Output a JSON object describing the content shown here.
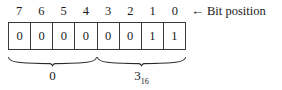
{
  "figure": {
    "type": "bit-field-diagram",
    "background_color": "#ffffff",
    "text_color": "#1a1a1a",
    "border_color": "#3a3a3a"
  },
  "bit_positions": {
    "labels": [
      "7",
      "6",
      "5",
      "4",
      "3",
      "2",
      "1",
      "0"
    ],
    "caption": "Bit position",
    "arrow": "←",
    "arrow_icon_name": "left-arrow-icon"
  },
  "bit_cells": {
    "values": [
      "0",
      "0",
      "0",
      "0",
      "0",
      "0",
      "1",
      "1"
    ],
    "count": 8
  },
  "groups": [
    {
      "name": "high-nibble",
      "spans_bits": [
        "7",
        "6",
        "5",
        "4"
      ],
      "label_value": "0",
      "label_subscript": ""
    },
    {
      "name": "low-nibble",
      "spans_bits": [
        "3",
        "2",
        "1",
        "0"
      ],
      "label_value": "3",
      "label_subscript": "16"
    }
  ]
}
